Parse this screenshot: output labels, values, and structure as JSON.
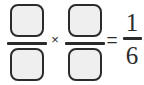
{
  "problem": {
    "type": "fraction-multiplication-blank",
    "operator_times": "×",
    "operator_equals": "=",
    "factors": [
      {
        "numerator": "",
        "denominator": "",
        "blank": true
      },
      {
        "numerator": "",
        "denominator": "",
        "blank": true
      }
    ],
    "result": {
      "numerator": "1",
      "denominator": "6"
    },
    "expression_text": "□/□ × □/□ = 1/6"
  },
  "colors": {
    "ink": "#2b2b2b",
    "box_fill": "#efefef",
    "background": "#ffffff"
  }
}
